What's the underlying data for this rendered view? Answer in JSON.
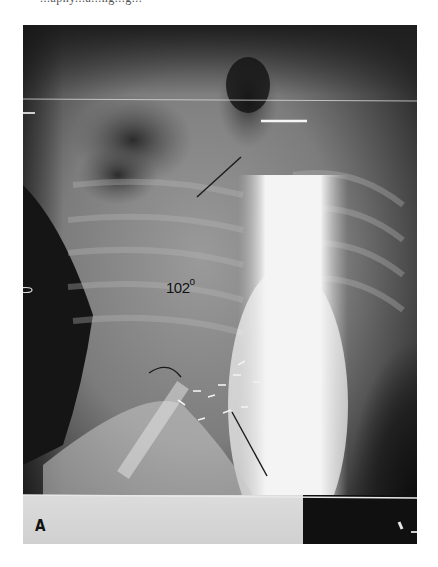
{
  "caption_cut_text": "...aphy...a...ng...g...",
  "figure": {
    "panel_label": "A",
    "type": "radiograph",
    "annotations": {
      "cobb_angle_value": "102",
      "cobb_angle_unit": "o"
    },
    "colors": {
      "background_dark": "#141414",
      "tissue_mid": "#7a7a7a",
      "bone_bright": "#f2f2f2",
      "annotation_line": "#1a1a1a"
    }
  }
}
